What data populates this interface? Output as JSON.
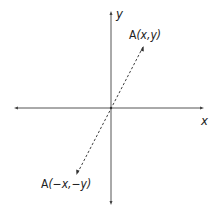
{
  "diagram": {
    "axes": {
      "x_label": "x",
      "y_label": "y",
      "color": "#555555"
    },
    "points": [
      {
        "id": "A",
        "label": "A(x,y)",
        "name": "A",
        "coords": "(x,y)"
      },
      {
        "id": "A_reflected",
        "label": "A(−x,−y)",
        "name": "A",
        "coords": "(−x,−y)"
      }
    ],
    "segment": {
      "style": "dashed",
      "from": "A(x,y)",
      "to": "A(−x,−y)",
      "through": "origin"
    }
  }
}
